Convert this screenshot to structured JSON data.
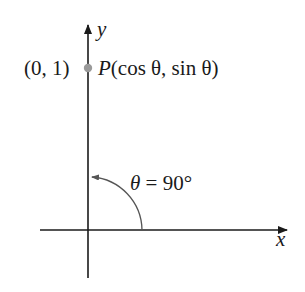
{
  "diagram": {
    "type": "unit-circle-angle",
    "axes": {
      "x_label": "x",
      "y_label": "y"
    },
    "point": {
      "coord_label": "(0, 1)",
      "name": "P",
      "expression": "(cos θ, sin θ)"
    },
    "angle": {
      "symbol": "θ",
      "equals": " = ",
      "value": "90°"
    },
    "colors": {
      "axis": "#1a1a1a",
      "arc": "#555555",
      "point": "#9a9a9a",
      "background": "#ffffff"
    }
  }
}
